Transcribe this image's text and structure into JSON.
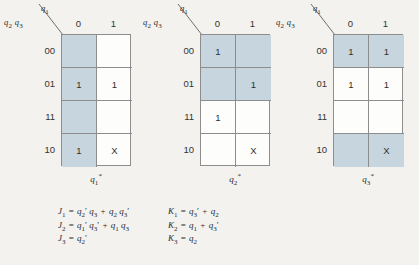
{
  "figure": {
    "background_color": "#f3f2ef",
    "shade_color": "#c6d5de",
    "border_color": "#8d8d8d"
  },
  "axis_labels": {
    "row_vars": "q₂ q₃",
    "col_var": "q₁"
  },
  "column_headers": [
    "0",
    "1"
  ],
  "row_headers": [
    "00",
    "01",
    "11",
    "10"
  ],
  "kmaps": [
    {
      "id": "kmap-q1-next",
      "caption": "q₁*",
      "cells": [
        [
          {
            "value": "",
            "shaded": true
          },
          {
            "value": "",
            "shaded": false
          }
        ],
        [
          {
            "value": "1",
            "shaded": true
          },
          {
            "value": "1",
            "shaded": false
          }
        ],
        [
          {
            "value": "",
            "shaded": true
          },
          {
            "value": "",
            "shaded": false
          }
        ],
        [
          {
            "value": "1",
            "shaded": true
          },
          {
            "value": "X",
            "shaded": false
          }
        ]
      ]
    },
    {
      "id": "kmap-q2-next",
      "caption": "q₂*",
      "cells": [
        [
          {
            "value": "1",
            "shaded": true
          },
          {
            "value": "",
            "shaded": true
          }
        ],
        [
          {
            "value": "",
            "shaded": true
          },
          {
            "value": "1",
            "shaded": true
          }
        ],
        [
          {
            "value": "1",
            "shaded": false
          },
          {
            "value": "",
            "shaded": false
          }
        ],
        [
          {
            "value": "",
            "shaded": false
          },
          {
            "value": "X",
            "shaded": false
          }
        ]
      ]
    },
    {
      "id": "kmap-q3-next",
      "caption": "q₃*",
      "cells": [
        [
          {
            "value": "1",
            "shaded": true
          },
          {
            "value": "1",
            "shaded": true
          }
        ],
        [
          {
            "value": "1",
            "shaded": false
          },
          {
            "value": "1",
            "shaded": false
          }
        ],
        [
          {
            "value": "",
            "shaded": false
          },
          {
            "value": "",
            "shaded": false
          }
        ],
        [
          {
            "value": "",
            "shaded": true
          },
          {
            "value": "X",
            "shaded": true
          }
        ]
      ]
    }
  ],
  "equations": {
    "left_column": [
      "J₁ = q₂' q₃ + q₂ q₃'",
      "J₂ = q₁' q₃' + q₁ q₃",
      "J₃ = q₂'"
    ],
    "right_column": [
      "K₁ = q₃' + q₂",
      "K₂ = q₁ + q₃'",
      "K₃ = q₂"
    ]
  }
}
